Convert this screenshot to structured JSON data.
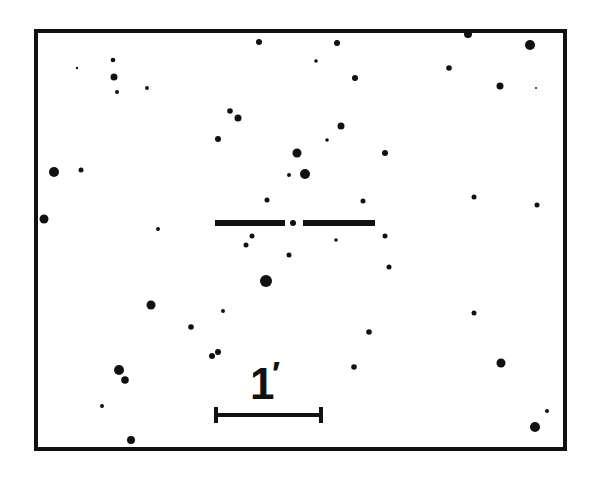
{
  "finding_chart": {
    "frame": {
      "x": 36,
      "y": 31,
      "width": 529,
      "height": 418,
      "stroke": 4,
      "color": "#111111"
    },
    "target_marker": {
      "center": [
        293,
        223
      ],
      "left_bar": [
        215,
        285
      ],
      "right_bar": [
        303,
        375
      ],
      "thickness": 6
    },
    "scale_bar": {
      "label": "1",
      "unit_symbol": "′",
      "x1": 216,
      "x2": 321,
      "y": 415,
      "tick_height": 16
    },
    "stars": [
      [
        259,
        42,
        3
      ],
      [
        337,
        43,
        3
      ],
      [
        468,
        34,
        4
      ],
      [
        530,
        45,
        5
      ],
      [
        77,
        68,
        1.2
      ],
      [
        113,
        60,
        2.3
      ],
      [
        114,
        77,
        3.5
      ],
      [
        117,
        92,
        2
      ],
      [
        147,
        88,
        2
      ],
      [
        316,
        61,
        1.8
      ],
      [
        355,
        78,
        3
      ],
      [
        449,
        68,
        2.8
      ],
      [
        500,
        86,
        3.5
      ],
      [
        536,
        88,
        1
      ],
      [
        230,
        111,
        2.8
      ],
      [
        238,
        118,
        3.5
      ],
      [
        218,
        139,
        3
      ],
      [
        341,
        126,
        3.5
      ],
      [
        327,
        140,
        1.8
      ],
      [
        297,
        153,
        4.5
      ],
      [
        385,
        153,
        3
      ],
      [
        289,
        175,
        2
      ],
      [
        305,
        174,
        5
      ],
      [
        54,
        172,
        5
      ],
      [
        81,
        170,
        2.5
      ],
      [
        44,
        219,
        4.5
      ],
      [
        158,
        229,
        2
      ],
      [
        267,
        200,
        2.5
      ],
      [
        363,
        201,
        2.5
      ],
      [
        474,
        197,
        2.5
      ],
      [
        537,
        205,
        2.5
      ],
      [
        252,
        236,
        2.5
      ],
      [
        246,
        245,
        2.5
      ],
      [
        289,
        255,
        2.5
      ],
      [
        336,
        240,
        1.8
      ],
      [
        385,
        236,
        2.5
      ],
      [
        389,
        267,
        2.5
      ],
      [
        266,
        281,
        6
      ],
      [
        151,
        305,
        4.5
      ],
      [
        223,
        311,
        2
      ],
      [
        191,
        327,
        2.8
      ],
      [
        369,
        332,
        2.8
      ],
      [
        474,
        313,
        2.5
      ],
      [
        212,
        356,
        3
      ],
      [
        218,
        352,
        3
      ],
      [
        354,
        367,
        2.8
      ],
      [
        501,
        363,
        4.5
      ],
      [
        119,
        370,
        5
      ],
      [
        125,
        380,
        3.8
      ],
      [
        102,
        406,
        2
      ],
      [
        131,
        440,
        4
      ],
      [
        547,
        411,
        2
      ],
      [
        535,
        427,
        5
      ]
    ],
    "colors": {
      "ink": "#111111",
      "background": "#ffffff"
    }
  }
}
